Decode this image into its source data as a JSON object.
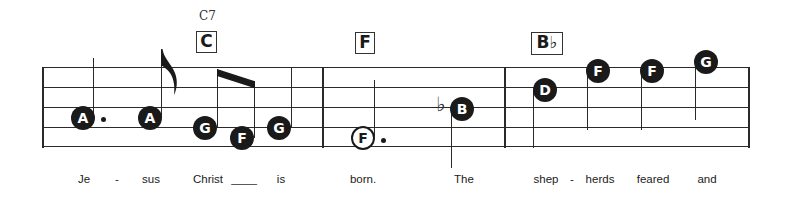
{
  "score": {
    "staff": {
      "lines_y": [
        68,
        88,
        108,
        128,
        147
      ],
      "x_start": 43,
      "x_end": 749
    },
    "barlines_x": [
      43,
      323,
      505,
      749
    ],
    "chords": [
      {
        "name_above": "C7",
        "symbol": "C",
        "x": 196
      },
      {
        "name_above": "",
        "symbol": "F",
        "x": 355
      },
      {
        "name_above": "",
        "symbol": "B♭",
        "x": 531
      }
    ],
    "notes": [
      {
        "letter": "A",
        "type": "dotted-quarter",
        "filled": true
      },
      {
        "letter": "A",
        "type": "eighth",
        "filled": true
      },
      {
        "letter": "G",
        "type": "eighth-beamed",
        "filled": true
      },
      {
        "letter": "F",
        "type": "eighth-beamed",
        "filled": true
      },
      {
        "letter": "G",
        "type": "quarter",
        "filled": true
      },
      {
        "letter": "F",
        "type": "dotted-half",
        "filled": false
      },
      {
        "letter": "B",
        "type": "quarter",
        "accidental": "♭",
        "filled": true
      },
      {
        "letter": "D",
        "type": "quarter",
        "filled": true
      },
      {
        "letter": "F",
        "type": "quarter",
        "filled": true
      },
      {
        "letter": "F",
        "type": "quarter",
        "filled": true
      },
      {
        "letter": "G",
        "type": "quarter",
        "filled": true
      }
    ],
    "lyrics": [
      "Je",
      "-",
      "sus",
      "Christ",
      "____",
      "is",
      "born.",
      "The",
      "shep",
      "-",
      "herds",
      "feared",
      "and"
    ]
  }
}
